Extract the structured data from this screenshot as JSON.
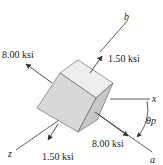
{
  "diagram": {
    "stresses": [
      {
        "label": "8.00 ksi",
        "position": "upper-left"
      },
      {
        "label": "1.50 ksi",
        "position": "upper-right"
      },
      {
        "label": "8.00 ksi",
        "position": "lower-right"
      },
      {
        "label": "1.50 ksi",
        "position": "lower-left"
      }
    ],
    "axes": {
      "b": "b",
      "x": "x",
      "z": "z",
      "a": "a"
    },
    "angle_label": "θp",
    "colors": {
      "cube_front": "#d8d8d8",
      "cube_top": "#eeeeee",
      "cube_side": "#c4c4c4",
      "lines": "#333333"
    }
  }
}
